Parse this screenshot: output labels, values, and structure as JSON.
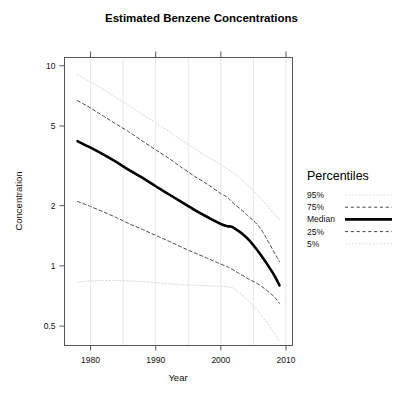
{
  "chart_data": {
    "type": "line",
    "title": "Estimated Benzene Concentrations",
    "xlabel": "Year",
    "ylabel": "Concentration",
    "yscale": "log",
    "ylim": [
      0.4,
      11
    ],
    "xlim": [
      1976,
      2011
    ],
    "grid": "vertical-only",
    "xticks": [
      1980,
      1990,
      2000,
      2010
    ],
    "xtick_labels": [
      "1980",
      "1990",
      "2000",
      "2010"
    ],
    "yticks": [
      0.5,
      1,
      2,
      5,
      10
    ],
    "ytick_labels": [
      "0.5",
      "1",
      "2",
      "5",
      "10"
    ],
    "legend": {
      "title": "Percentiles",
      "position": "right",
      "entries": [
        {
          "label": "95%",
          "style": "dotted",
          "color": "#d8d8d8",
          "width": 1.0
        },
        {
          "label": "75%",
          "style": "dashed",
          "color": "#4a4a4a",
          "width": 1.0
        },
        {
          "label": "Median",
          "style": "solid",
          "color": "#000000",
          "width": 2.6
        },
        {
          "label": "25%",
          "style": "dashed",
          "color": "#4a4a4a",
          "width": 1.0
        },
        {
          "label": "5%",
          "style": "dotted",
          "color": "#d8d8d8",
          "width": 1.0
        }
      ]
    },
    "x": [
      1978,
      1980,
      1982,
      1984,
      1986,
      1988,
      1990,
      1992,
      1994,
      1996,
      1998,
      2000,
      2001,
      2002,
      2004,
      2006,
      2008,
      2009
    ],
    "series": [
      {
        "name": "95%",
        "values": [
          9.0,
          8.3,
          7.6,
          6.9,
          6.3,
          5.7,
          5.2,
          4.7,
          4.25,
          3.85,
          3.5,
          3.2,
          3.05,
          2.9,
          2.55,
          2.2,
          1.85,
          1.7
        ]
      },
      {
        "name": "75%",
        "values": [
          6.7,
          6.15,
          5.6,
          5.1,
          4.65,
          4.2,
          3.8,
          3.45,
          3.1,
          2.8,
          2.55,
          2.3,
          2.2,
          2.05,
          1.8,
          1.55,
          1.2,
          1.05
        ]
      },
      {
        "name": "Median",
        "values": [
          4.2,
          3.9,
          3.6,
          3.3,
          3.0,
          2.75,
          2.5,
          2.28,
          2.08,
          1.9,
          1.75,
          1.62,
          1.58,
          1.55,
          1.38,
          1.15,
          0.92,
          0.8
        ]
      },
      {
        "name": "25%",
        "values": [
          2.1,
          1.98,
          1.86,
          1.74,
          1.62,
          1.52,
          1.42,
          1.33,
          1.24,
          1.16,
          1.09,
          1.02,
          0.99,
          0.95,
          0.87,
          0.8,
          0.71,
          0.65
        ]
      },
      {
        "name": "5%",
        "values": [
          0.83,
          0.84,
          0.845,
          0.845,
          0.84,
          0.835,
          0.825,
          0.815,
          0.805,
          0.8,
          0.795,
          0.79,
          0.785,
          0.77,
          0.68,
          0.58,
          0.47,
          0.42
        ]
      }
    ]
  },
  "axes": {
    "title": "Estimated Benzene Concentrations",
    "xlabel": "Year",
    "ylabel": "Concentration"
  }
}
